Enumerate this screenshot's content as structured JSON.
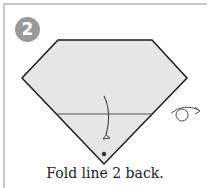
{
  "step": {
    "number": "2",
    "caption": "Fold line 2 back."
  },
  "colors": {
    "paper_fill": "#e6e6e6",
    "outline": "#1a1a1a",
    "badge": "#9a9a9a",
    "frame": "#c8c8c8"
  },
  "icons": {
    "fold_arrow": "curved-fold-back-arrow",
    "turn_over": "turn-over-icon",
    "reference_dot": "point-marker"
  }
}
